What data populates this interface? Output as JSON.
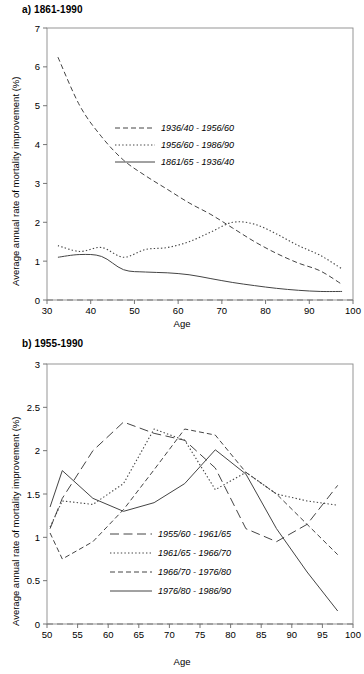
{
  "figure": {
    "ylabel": "Average annual rate of mortality improvement (%)",
    "xlabel": "Age"
  },
  "panels": {
    "a": {
      "title": "a) 1861-1990"
    },
    "b": {
      "title": "b) 1955-1990"
    }
  },
  "chart_data": [
    {
      "id": "chart-a",
      "type": "line",
      "title": "a) 1861-1990",
      "xlabel": "Age",
      "ylabel": "Average annual rate of mortality improvement (%)",
      "xlim": [
        30,
        100
      ],
      "ylim": [
        0,
        7
      ],
      "xticks": [
        30,
        40,
        50,
        60,
        70,
        80,
        90,
        100
      ],
      "yticks": [
        0,
        1,
        2,
        3,
        4,
        5,
        6,
        7
      ],
      "grid": false,
      "legend_position": "upper-center",
      "zero_reference_line": 0,
      "series": [
        {
          "name": "1936/40 - 1956/60",
          "style": "dashed",
          "x": [
            32.5,
            37.5,
            42.5,
            47.5,
            52.5,
            57.5,
            62.5,
            67.5,
            72.5,
            77.5,
            82.5,
            87.5,
            92.5,
            97.5
          ],
          "values": [
            6.25,
            5.0,
            4.2,
            3.6,
            3.2,
            2.85,
            2.5,
            2.2,
            1.85,
            1.5,
            1.2,
            0.95,
            0.75,
            0.4
          ]
        },
        {
          "name": "1956/60 - 1986/90",
          "style": "dotted",
          "x": [
            32.5,
            37.5,
            42.5,
            47.5,
            52.5,
            57.5,
            62.5,
            67.5,
            72.5,
            77.5,
            82.5,
            87.5,
            92.5,
            97.5
          ],
          "values": [
            1.4,
            1.25,
            1.35,
            1.1,
            1.3,
            1.35,
            1.5,
            1.75,
            2.0,
            1.95,
            1.7,
            1.4,
            1.15,
            0.8
          ]
        },
        {
          "name": "1861/65 - 1936/40",
          "style": "solid",
          "x": [
            32.5,
            37.5,
            42.5,
            47.5,
            52.5,
            57.5,
            62.5,
            67.5,
            72.5,
            77.5,
            82.5,
            87.5,
            92.5,
            97.5
          ],
          "values": [
            1.1,
            1.17,
            1.12,
            0.78,
            0.72,
            0.7,
            0.65,
            0.55,
            0.45,
            0.37,
            0.3,
            0.25,
            0.22,
            0.22
          ]
        }
      ]
    },
    {
      "id": "chart-b",
      "type": "line",
      "title": "b) 1955-1990",
      "xlabel": "Age",
      "ylabel": "Average annual rate of mortality improvement (%)",
      "xlim": [
        50,
        100
      ],
      "ylim": [
        0,
        3
      ],
      "xticks": [
        50,
        55,
        60,
        65,
        70,
        75,
        80,
        85,
        90,
        95,
        100
      ],
      "yticks": [
        0,
        0.5,
        1,
        1.5,
        2,
        2.5,
        3
      ],
      "grid": false,
      "legend_position": "lower-center",
      "zero_reference_line": 0,
      "series": [
        {
          "name": "1955/60 - 1961/65",
          "style": "long-dash",
          "x": [
            50.5,
            52.5,
            57.5,
            62.5,
            67.5,
            72.5,
            77.5,
            82.5,
            87.5,
            92.5,
            97.5
          ],
          "values": [
            1.1,
            1.45,
            2.0,
            2.33,
            2.2,
            2.12,
            1.8,
            1.1,
            0.95,
            1.15,
            1.6
          ]
        },
        {
          "name": "1961/65 - 1966/70",
          "style": "dotted",
          "x": [
            50.5,
            52.5,
            57.5,
            62.5,
            67.5,
            72.5,
            77.5,
            82.5,
            87.5,
            92.5,
            97.5
          ],
          "values": [
            1.12,
            1.42,
            1.38,
            1.62,
            2.25,
            2.12,
            1.55,
            1.75,
            1.5,
            1.42,
            1.37
          ]
        },
        {
          "name": "1966/70 - 1976/80",
          "style": "dashed",
          "x": [
            50.5,
            52.5,
            57.5,
            62.5,
            67.5,
            72.5,
            77.5,
            82.5,
            87.5,
            92.5,
            97.5
          ],
          "values": [
            1.05,
            0.75,
            0.95,
            1.32,
            1.78,
            2.25,
            2.18,
            1.75,
            1.5,
            1.15,
            0.8
          ]
        },
        {
          "name": "1976/80 - 1986/90",
          "style": "solid",
          "x": [
            50.5,
            52.5,
            57.5,
            62.5,
            67.5,
            72.5,
            77.5,
            82.5,
            87.5,
            92.5,
            97.5
          ],
          "values": [
            1.35,
            1.77,
            1.45,
            1.3,
            1.4,
            1.62,
            2.01,
            1.73,
            1.1,
            0.6,
            0.15
          ]
        }
      ]
    }
  ]
}
